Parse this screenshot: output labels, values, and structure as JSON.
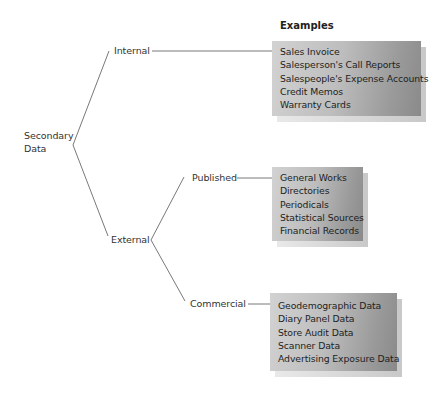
{
  "diagram": {
    "heading": "Examples",
    "root": {
      "label_line1": "Secondary",
      "label_line2": "Data"
    },
    "branches": {
      "internal": {
        "label": "Internal",
        "examples": [
          "Sales Invoice",
          "Salesperson's Call Reports",
          "Salespeople's Expense Accounts",
          "Credit Memos",
          "Warranty Cards"
        ]
      },
      "external": {
        "label": "External",
        "children": {
          "published": {
            "label": "Published",
            "examples": [
              "General Works",
              "Directories",
              "Periodicals",
              "Statistical Sources",
              "Financial Records"
            ]
          },
          "commercial": {
            "label": "Commercial",
            "examples": [
              "Geodemographic Data",
              "Diary Panel Data",
              "Store Audit Data",
              "Scanner Data",
              "Advertising Exposure Data"
            ]
          }
        }
      }
    },
    "colors": {
      "line": "#555555",
      "box_light": "#d2d2d2",
      "box_dark": "#8a8a8a",
      "text": "#222222"
    }
  }
}
